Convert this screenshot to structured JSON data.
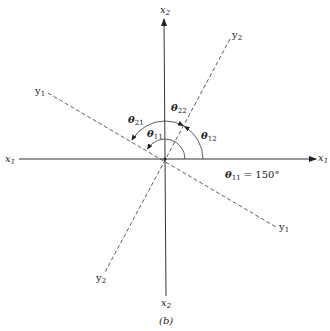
{
  "figure": {
    "caption": "(b)",
    "axes": {
      "x1_pos": {
        "base": "x",
        "sub": "1"
      },
      "x1_neg": {
        "base": "x",
        "sub": "1"
      },
      "x2_pos": {
        "base": "x",
        "sub": "2"
      },
      "x2_neg": {
        "base": "x",
        "sub": "2"
      },
      "y1_a": {
        "base": "y",
        "sub": "1"
      },
      "y1_b": {
        "base": "y",
        "sub": "1"
      },
      "y2_a": {
        "base": "y",
        "sub": "2"
      },
      "y2_b": {
        "base": "y",
        "sub": "2"
      }
    },
    "angles": {
      "t11": {
        "base": "θ",
        "sub": "11"
      },
      "t12": {
        "base": "θ",
        "sub": "12"
      },
      "t21": {
        "base": "θ",
        "sub": "21"
      },
      "t22": {
        "base": "θ",
        "sub": "22"
      }
    },
    "annotation": {
      "base": "θ",
      "sub": "11",
      "rest": " = 150°"
    },
    "colors": {
      "ink": "#222222",
      "background": "#ffffff"
    }
  }
}
